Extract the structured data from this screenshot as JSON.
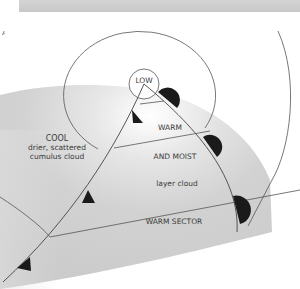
{
  "diagram": {
    "type": "weather-front-depression",
    "labels": {
      "low": "LOW",
      "cool_title": "COOL",
      "cool_line1": "drier, scattered",
      "cool_line2": "cumulus cloud",
      "warm": "WARM",
      "and_moist": "AND MOIST",
      "layer_cloud": "layer cloud",
      "warm_sector": "WARM SECTOR"
    },
    "fronts": [
      {
        "name": "cold-front",
        "symbol": "triangle",
        "count": 3
      },
      {
        "name": "warm-front",
        "symbol": "semicircle",
        "count": 3
      }
    ],
    "isobars": 3,
    "colors": {
      "shading": "#c9c9c9",
      "line": "#555555",
      "symbol": "#1a1a1a",
      "topbar": "#cecece"
    }
  }
}
